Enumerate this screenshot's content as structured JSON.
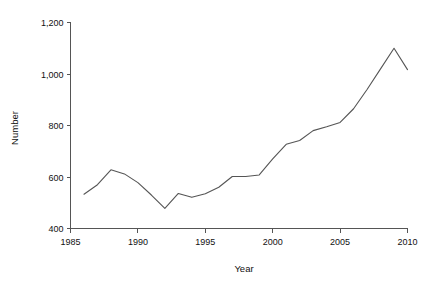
{
  "chart_data": {
    "type": "line",
    "title": "",
    "xlabel": "Year",
    "ylabel": "Number",
    "xlim": [
      1985,
      2010
    ],
    "ylim": [
      400,
      1200
    ],
    "grid": false,
    "legend": null,
    "line_color": "#555555",
    "x": [
      1986,
      1987,
      1988,
      1989,
      1990,
      1991,
      1992,
      1993,
      1994,
      1995,
      1996,
      1997,
      1998,
      1999,
      2000,
      2001,
      2002,
      2003,
      2004,
      2005,
      2006,
      2007,
      2008,
      2009,
      2010
    ],
    "values": [
      533,
      570,
      628,
      612,
      578,
      530,
      478,
      536,
      521,
      535,
      560,
      602,
      602,
      608,
      670,
      727,
      742,
      780,
      795,
      812,
      865,
      940,
      1020,
      1100,
      1017
    ],
    "series": [
      {
        "name": "Number",
        "values": [
          533,
          570,
          628,
          612,
          578,
          530,
          478,
          536,
          521,
          535,
          560,
          602,
          602,
          608,
          670,
          727,
          742,
          780,
          795,
          812,
          865,
          940,
          1020,
          1100,
          1017
        ]
      }
    ],
    "x_ticks": [
      1985,
      1990,
      1995,
      2000,
      2005,
      2010
    ],
    "x_tick_labels": [
      "1985",
      "1990",
      "1995",
      "2000",
      "2005",
      "2010"
    ],
    "y_ticks": [
      400,
      600,
      800,
      1000,
      1200
    ],
    "y_tick_labels": [
      "400",
      "600",
      "800",
      "1,000",
      "1,200"
    ]
  }
}
